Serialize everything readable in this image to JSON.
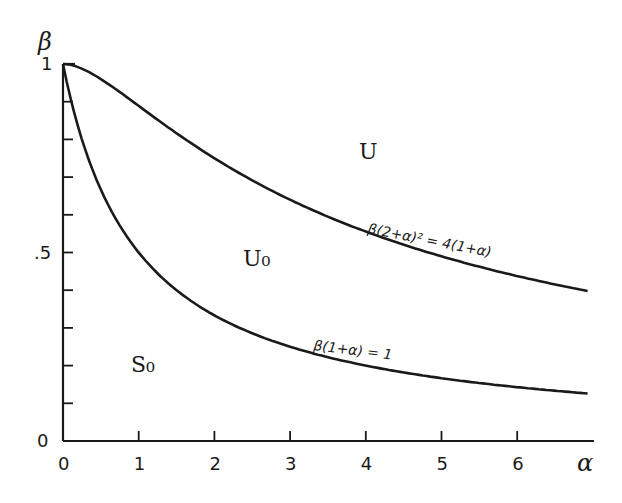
{
  "chart_data": {
    "type": "line",
    "title": "",
    "xlabel": "α",
    "ylabel": "β",
    "xlim": [
      0,
      7
    ],
    "ylim": [
      0,
      1
    ],
    "grid": false,
    "x_ticks": [
      "0",
      "1",
      "2",
      "3",
      "4",
      "5",
      "6"
    ],
    "y_ticks": [
      "0",
      ".5",
      "1"
    ],
    "y_minor_ticks": [
      0.1,
      0.2,
      0.3,
      0.4,
      0.6,
      0.7,
      0.8,
      0.9
    ],
    "series": [
      {
        "name": "β(2+α)² = 4(1+α)",
        "x": [
          0,
          0.5,
          1,
          1.5,
          2,
          2.5,
          3,
          3.5,
          4,
          4.5,
          5,
          5.5,
          6,
          6.5,
          6.93
        ],
        "values": [
          1.0,
          0.96,
          0.889,
          0.816,
          0.75,
          0.691,
          0.64,
          0.595,
          0.556,
          0.521,
          0.49,
          0.462,
          0.438,
          0.415,
          0.398
        ]
      },
      {
        "name": "β(1+α) = 1",
        "x": [
          0,
          0.5,
          1,
          1.5,
          2,
          2.5,
          3,
          3.5,
          4,
          4.5,
          5,
          5.5,
          6,
          6.5,
          6.93
        ],
        "values": [
          1.0,
          0.667,
          0.5,
          0.4,
          0.333,
          0.286,
          0.25,
          0.222,
          0.2,
          0.182,
          0.167,
          0.154,
          0.143,
          0.133,
          0.126
        ]
      }
    ],
    "annotations": [
      {
        "text": "U",
        "x": 3.05,
        "y": 0.78
      },
      {
        "text": "U₀",
        "x": 1.55,
        "y": 0.48
      },
      {
        "text": "S₀",
        "x": 0.85,
        "y": 0.19
      },
      {
        "text": "β(2+α)² = 4(1+α)",
        "x": 4.0,
        "y": 0.55
      },
      {
        "text": "β(1+α) = 1",
        "x": 2.3,
        "y": 0.25
      }
    ]
  },
  "labels": {
    "x_axis": "α",
    "y_axis": "β",
    "region_u": "U",
    "region_u0": "U₀",
    "region_s0": "S₀",
    "upper_curve_eq": "β(2+α)² = 4(1+α)",
    "lower_curve_eq": "β(1+α) = 1",
    "y_tick_0": "0",
    "y_tick_half": ".5",
    "y_tick_1": "1",
    "x_ticks": [
      "0",
      "1",
      "2",
      "3",
      "4",
      "5",
      "6"
    ]
  }
}
